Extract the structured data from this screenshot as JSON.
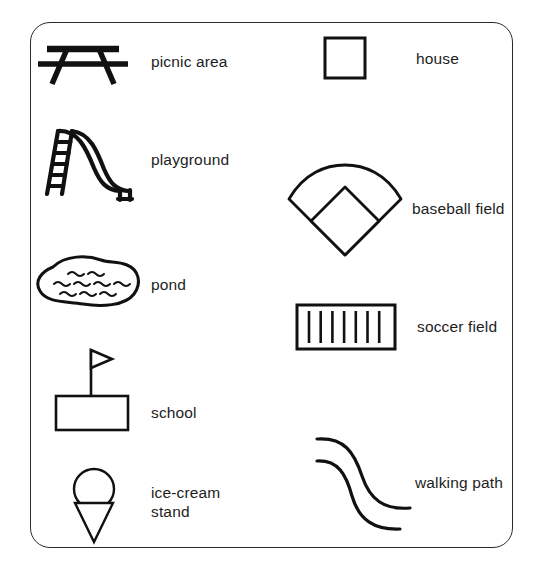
{
  "legend": {
    "title": "Park Map Legend",
    "frame": {
      "border_color": "#2b2b2b",
      "background": "#ffffff",
      "corner_radius": 20
    },
    "ink_color": "#111111",
    "text_color": "#1d1d1d",
    "columns": [
      {
        "name": "left-column",
        "entries": [
          {
            "id": "picnic-area",
            "icon": "picnic-table-icon",
            "label": "picnic area"
          },
          {
            "id": "playground",
            "icon": "slide-icon",
            "label": "playground"
          },
          {
            "id": "pond",
            "icon": "pond-blob-icon",
            "label": "pond"
          },
          {
            "id": "school",
            "icon": "school-flag-icon",
            "label": "school"
          },
          {
            "id": "ice-cream-stand",
            "icon": "ice-cream-cone-icon",
            "label": "ice-cream\nstand"
          }
        ]
      },
      {
        "name": "right-column",
        "entries": [
          {
            "id": "house",
            "icon": "square-icon",
            "label": "house"
          },
          {
            "id": "baseball-field",
            "icon": "baseball-diamond-icon",
            "label": "baseball field"
          },
          {
            "id": "soccer-field",
            "icon": "striped-rectangle-icon",
            "label": "soccer field"
          },
          {
            "id": "walking-path",
            "icon": "double-curve-icon",
            "label": "walking path"
          }
        ]
      }
    ]
  }
}
